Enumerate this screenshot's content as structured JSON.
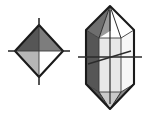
{
  "figure": {
    "background_color": "#ffffff",
    "width": 145,
    "height": 115
  },
  "palette": {
    "outline": "#1a1a1a",
    "axis_line": "#2b2b2b",
    "dark_gray": "#565656",
    "medium_gray": "#7d7d7d",
    "light_gray": "#b6b6b6",
    "pale_gray": "#d8d8d8",
    "near_white": "#f2f2f2",
    "white": "#ffffff"
  },
  "shapes": {
    "octahedron": {
      "name": "octahedron",
      "label": "left crystal form",
      "outline_points": "39,25 63,51 39,77 15,51",
      "faces": [
        {
          "id": "upper-left-face",
          "points": "39,25 39,51 15,51",
          "fill": "#565656"
        },
        {
          "id": "upper-right-face",
          "points": "39,25 63,51 39,51",
          "fill": "#7d7d7d"
        },
        {
          "id": "lower-left-face",
          "points": "39,51 39,77 15,51",
          "fill": "#b6b6b6"
        },
        {
          "id": "lower-right-face",
          "points": "39,51 63,51 39,77",
          "fill": "#ffffff"
        }
      ],
      "axes": [
        {
          "id": "vertical-axis",
          "x1": 39,
          "y1": 18,
          "x2": 39,
          "y2": 85
        },
        {
          "id": "horizontal-axis",
          "x1": 8,
          "y1": 51,
          "x2": 70,
          "y2": 51
        }
      ]
    },
    "hexagonal_prism": {
      "name": "hexagonal-dipyramid-prism",
      "label": "right crystal form",
      "outline_points": "110,6 134,30 134,84 110,109 86,84 86,30",
      "faces": [
        {
          "id": "prism-left-face",
          "points": "86,30 99,38 99,92 86,84",
          "fill": "#565656"
        },
        {
          "id": "prism-center-face",
          "points": "99,38 121,38 121,92 99,92",
          "fill": "#e8e8e8"
        },
        {
          "id": "prism-right-face",
          "points": "121,38 134,30 134,84 121,92",
          "fill": "#f7f7f7"
        },
        {
          "id": "top-pyramid-left-face",
          "points": "110,6 86,30 99,38",
          "fill": "#6e6e6e"
        },
        {
          "id": "top-pyramid-center-left-face",
          "points": "110,6 99,38 110,31",
          "fill": "#9a9a9a"
        },
        {
          "id": "top-pyramid-center-right-face",
          "points": "110,6 110,31 121,38",
          "fill": "#ffffff"
        },
        {
          "id": "top-pyramid-right-face",
          "points": "110,6 121,38 134,30",
          "fill": "#ffffff"
        },
        {
          "id": "bottom-pyramid-left-face",
          "points": "86,84 99,92 110,109",
          "fill": "#565656"
        },
        {
          "id": "bottom-pyramid-center-face",
          "points": "99,92 121,92 110,109",
          "fill": "#c9c9c9"
        },
        {
          "id": "bottom-pyramid-right-face",
          "points": "121,92 134,84 110,109",
          "fill": "#8a8a8a"
        }
      ],
      "hidden_edges": [
        {
          "id": "hidden-vertical-edge",
          "x1": 99,
          "y1": 38,
          "x2": 99,
          "y2": 92
        },
        {
          "id": "hidden-front-edge",
          "x1": 121,
          "y1": 38,
          "x2": 121,
          "y2": 92
        }
      ],
      "axes": [
        {
          "id": "vertical-axis",
          "x1": 110,
          "y1": 10,
          "x2": 110,
          "y2": 104
        },
        {
          "id": "horizontal-axis",
          "x1": 78,
          "y1": 57,
          "x2": 142,
          "y2": 57
        },
        {
          "id": "oblique-axis",
          "x1": 88,
          "y1": 64,
          "x2": 131,
          "y2": 51
        }
      ]
    }
  }
}
